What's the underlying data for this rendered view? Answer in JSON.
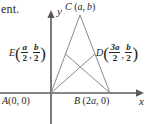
{
  "figure": {
    "kind": "coordinate-geometry-diagram",
    "stroke_color": "#8a8a8a",
    "axis_color": "#5a5a5a",
    "text_color": "#262626",
    "background": "#ffffff"
  },
  "text_fragment": "ent.",
  "axes": {
    "x_label": "x",
    "y_label": "y",
    "origin_px": {
      "x": 51,
      "y": 93
    }
  },
  "points": {
    "A": {
      "name": "A",
      "coords_text": "(0, 0)",
      "x_value": "0",
      "y_value": "0",
      "px": {
        "x": 51,
        "y": 93
      }
    },
    "B": {
      "name": "B",
      "coords_text": "(2a, 0)",
      "x_value": "2a",
      "y_value": "0",
      "px": {
        "x": 110,
        "y": 93
      }
    },
    "C": {
      "name": "C",
      "coords_text": "(a, b)",
      "x_value": "a",
      "y_value": "b",
      "px": {
        "x": 80,
        "y": 14
      }
    },
    "D": {
      "name": "D",
      "coords_text": "(3a/2, b/2)",
      "x_num": "3a",
      "x_den": "2",
      "y_num": "b",
      "y_den": "2",
      "px": {
        "x": 95,
        "y": 54
      }
    },
    "E": {
      "name": "E",
      "coords_text": "(a/2, b/2)",
      "x_num": "a",
      "x_den": "2",
      "y_num": "b",
      "y_den": "2",
      "px": {
        "x": 65,
        "y": 54
      }
    }
  },
  "segments": [
    {
      "name": "side-AC",
      "from": "A",
      "to": "C"
    },
    {
      "name": "side-BC",
      "from": "B",
      "to": "C"
    },
    {
      "name": "side-AB",
      "from": "A",
      "to": "B"
    },
    {
      "name": "median-AD",
      "from": "A",
      "to": "D"
    },
    {
      "name": "median-BE",
      "from": "B",
      "to": "E"
    }
  ]
}
